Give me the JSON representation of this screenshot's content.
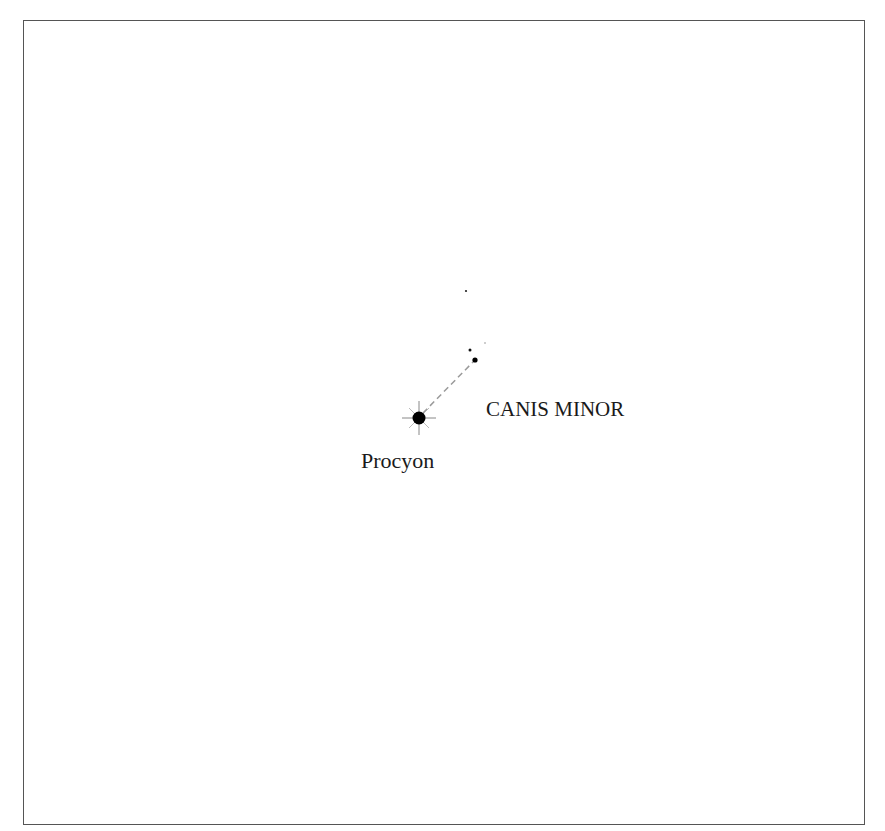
{
  "map": {
    "constellation": "CANIS MINOR",
    "stars": [
      {
        "name": "Procyon",
        "label": "Procyon",
        "x": 419,
        "y": 418,
        "r": 6,
        "type": "bright-star"
      },
      {
        "name": "Gomeisa",
        "x": 475,
        "y": 360,
        "r": 2.6,
        "type": "star"
      },
      {
        "name": "star-3",
        "x": 470,
        "y": 350,
        "r": 1.5,
        "type": "star"
      },
      {
        "name": "star-4",
        "x": 466,
        "y": 291,
        "r": 1.1,
        "type": "star"
      },
      {
        "name": "star-5",
        "x": 485,
        "y": 343,
        "r": 0.6,
        "type": "star"
      }
    ],
    "lines": [
      {
        "from": "Procyon",
        "to": "Gomeisa",
        "style": "dashed",
        "color": "#9a9a9a"
      }
    ],
    "colors": {
      "star": "#000000",
      "border": "#555555",
      "line": "#9a9a9a"
    }
  }
}
